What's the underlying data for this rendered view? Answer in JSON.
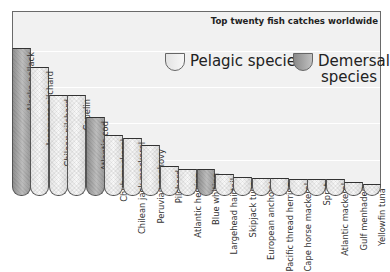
{
  "chart_data": {
    "type": "bar",
    "title": "Top twenty fish catches worldwide",
    "xlabel": "",
    "ylabel": "",
    "grid": true,
    "legend_position": "upper-right",
    "legend": [
      {
        "name": "Pelagic species",
        "style": "light"
      },
      {
        "name": "Demersal species",
        "style": "dark"
      }
    ],
    "categories": [
      "Alaska pollack",
      "Japanese pilchard",
      "Chilean pilchard",
      "Capelin",
      "Atlantic cod",
      "Chub mackerel",
      "Chilean jack mackerel",
      "Peruvian anchovy",
      "Pilchard",
      "Atlantic herring",
      "Blue whiting",
      "Largehead hairtail",
      "Skipjack tuna",
      "European anchovy",
      "Pacific thread herring",
      "Cape horse mackerel",
      "Sprat",
      "Atlantic mackerel",
      "Gulf menhaden",
      "Yellowfin tuna"
    ],
    "types": [
      "demersal",
      "pelagic",
      "pelagic",
      "pelagic",
      "demersal",
      "pelagic",
      "pelagic",
      "pelagic",
      "pelagic",
      "pelagic",
      "demersal",
      "pelagic",
      "pelagic",
      "pelagic",
      "pelagic",
      "pelagic",
      "pelagic",
      "pelagic",
      "pelagic",
      "pelagic"
    ],
    "values": [
      148,
      129,
      101,
      101,
      79,
      61,
      58,
      51,
      30,
      27,
      27,
      22,
      19,
      18,
      18,
      17,
      17,
      17,
      14,
      12
    ],
    "value_unit": "relative height (px, no axis shown)"
  },
  "title": "Top twenty fish catches worldwide",
  "legend": {
    "pelagic": "Pelagic species",
    "demersal_line1": "Demersal",
    "demersal_line2": "species"
  },
  "colors": {
    "pelagic": "#eeeeee",
    "demersal": "#a5a5a5",
    "frame": "#6a6a6a",
    "background": "#f1f1f1"
  }
}
